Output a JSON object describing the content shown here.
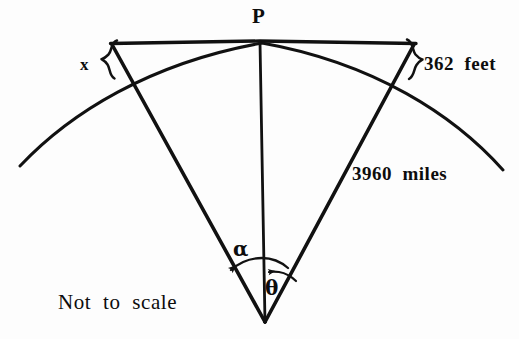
{
  "figure": {
    "background_color": "#fdfdfd",
    "ink_color": "#111111",
    "labels": {
      "apex_point": "P",
      "short_segment": "x",
      "arc_length": "362  feet",
      "radius": "3960  miles",
      "angle_alpha": "α",
      "angle_theta": "θ",
      "note": "Not  to  scale"
    },
    "geometry": {
      "center_x": 265,
      "center_y": 322,
      "tangent_point_x": 260,
      "tangent_point_y": 42,
      "tangent_left_x": 110,
      "tangent_right_x": 416,
      "arc_left_end_x": 20,
      "arc_left_end_y": 166,
      "arc_right_end_x": 503,
      "arc_right_end_y": 170,
      "left_radius_arc_intersect_x": 128,
      "left_radius_arc_intersect_y": 78,
      "right_radius_arc_intersect_x": 396,
      "right_radius_arc_intersect_y": 78
    },
    "elements": [
      "tangent-line",
      "circle-arc",
      "left-radius-line",
      "right-radius-line",
      "vertical-axis-line",
      "left-brace",
      "right-brace",
      "alpha-angle-arc",
      "theta-angle-arc"
    ]
  }
}
